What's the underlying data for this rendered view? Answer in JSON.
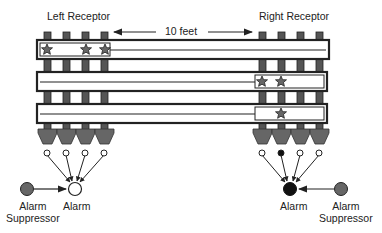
{
  "labels": {
    "left_receptor": "Left Receptor",
    "right_receptor": "Right Receptor",
    "distance": "10 feet",
    "left_alarm": "Alarm",
    "left_suppressor": "Alarm\nSuppressor",
    "left_suppressor_line1": "Alarm",
    "left_suppressor_line2": "Suppressor",
    "right_alarm": "Alarm",
    "right_suppressor_line1": "Alarm",
    "right_suppressor_line2": "Suppressor"
  },
  "colors": {
    "post": "#555555",
    "funnel": "#666666",
    "suppressor": "#666666",
    "active": "#111111",
    "inactive": "#ffffff",
    "outline": "#222222"
  },
  "left_receptor": {
    "posts": 4,
    "signals": [
      "off",
      "off",
      "off",
      "off"
    ],
    "alarm_state": "off",
    "stars_on_bar1": 3
  },
  "right_receptor": {
    "posts": 4,
    "signals": [
      "off",
      "on",
      "off",
      "off"
    ],
    "alarm_state": "on",
    "stars_on_bar2": 2,
    "stars_on_bar3": 1
  }
}
